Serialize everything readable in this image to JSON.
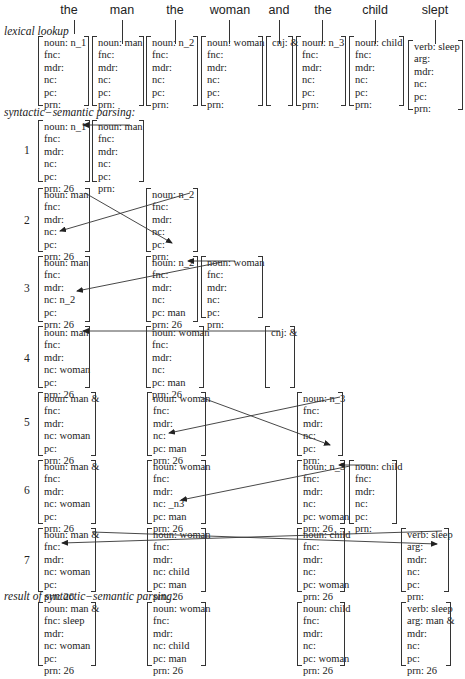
{
  "words": [
    "the",
    "man",
    "the",
    "woman",
    "and",
    "the",
    "child",
    "slept"
  ],
  "labels": {
    "lexical": "lexical lookup",
    "parsing": "syntactic−semantic parsing:",
    "result": "result of syntactic−semantic parsing:"
  },
  "lexical": [
    [
      "noun: n_1",
      "fnc:",
      "mdr:",
      "nc:",
      "pc:",
      "prn:"
    ],
    [
      "noun: man",
      "fnc:",
      "mdr:",
      "nc:",
      "pc:",
      "prn:"
    ],
    [
      "noun: n_2",
      "fnc:",
      "mdr:",
      "nc:",
      "pc:",
      "prn:"
    ],
    [
      "noun: woman",
      "fnc:",
      "mdr:",
      "nc:",
      "pc:",
      "prn:"
    ],
    [
      "cnj: &"
    ],
    [
      "noun: n_3",
      "fnc:",
      "mdr:",
      "nc:",
      "pc:",
      "prn:"
    ],
    [
      "noun: child",
      "fnc:",
      "mdr:",
      "nc:",
      "pc:",
      "prn:"
    ],
    [
      "verb: sleep",
      "arg:",
      "mdr:",
      "nc:",
      "pc:",
      "prn:"
    ]
  ],
  "steps": {
    "s1": {
      "num": "1",
      "a": [
        "noun: n_1",
        "fnc:",
        "mdr:",
        "nc:",
        "pc:",
        "prn: 26"
      ],
      "b": [
        "noun: man",
        "fnc:",
        "mdr:",
        "nc:",
        "pc:",
        "prn:"
      ]
    },
    "s2": {
      "num": "2",
      "a": [
        "noun: man",
        "fnc:",
        "mdr:",
        "nc:",
        "pc:",
        "prn: 26"
      ],
      "b": [
        "noun: n_2",
        "fnc:",
        "mdr:",
        "nc:",
        "pc:",
        "prn:"
      ]
    },
    "s3": {
      "num": "3",
      "a": [
        "noun: man",
        "fnc:",
        "mdr:",
        "nc: n_2",
        "pc:",
        "prn: 26"
      ],
      "b": [
        "noun: n_2",
        "fnc:",
        "mdr:",
        "nc:",
        "pc: man",
        "prn: 26"
      ],
      "c": [
        "noun: woman",
        "fnc:",
        "mdr:",
        "nc:",
        "pc:",
        "prn:"
      ]
    },
    "s4": {
      "num": "4",
      "a": [
        "noun: man",
        "fnc:",
        "mdr:",
        "nc: woman",
        "pc:",
        "prn: 26"
      ],
      "b": [
        "noun: woman",
        "fnc:",
        "mdr:",
        "nc:",
        "pc: man",
        "prn: 26"
      ],
      "c": [
        "cnj: &"
      ]
    },
    "s5": {
      "num": "5",
      "a": [
        "noun: man &",
        "fnc:",
        "mdr:",
        "nc: woman",
        "pc:",
        "prn: 26"
      ],
      "b": [
        "noun: woman",
        "fnc:",
        "mdr:",
        "nc:",
        "pc: man",
        "prn: 26"
      ],
      "c": [
        "noun: n_3",
        "fnc:",
        "mdr:",
        "nc:",
        "pc:",
        "prn:"
      ]
    },
    "s6": {
      "num": "6",
      "a": [
        "noun: man &",
        "fnc:",
        "mdr:",
        "nc: woman",
        "pc:",
        "prn: 26"
      ],
      "b": [
        "noun: woman",
        "fnc:",
        "mdr:",
        "nc: _n3",
        "pc: man",
        "prn: 26"
      ],
      "c": [
        "noun: n_3",
        "fnc:",
        "mdr:",
        "nc:",
        "pc: woman",
        "prn: 26"
      ],
      "d": [
        "noun: child",
        "fnc:",
        "mdr:",
        "nc:",
        "pc:",
        "prn:"
      ]
    },
    "s7": {
      "num": "7",
      "a": [
        "noun: man &",
        "fnc:",
        "mdr:",
        "nc: woman",
        "pc:",
        "prn: 26"
      ],
      "b": [
        "noun: woman",
        "fnc:",
        "mdr:",
        "nc: child",
        "pc: man",
        "prn: 26"
      ],
      "c": [
        "noun: child",
        "fnc:",
        "mdr:",
        "nc:",
        "pc: woman",
        "prn: 26"
      ],
      "d": [
        "verb: sleep",
        "arg:",
        "mdr:",
        "nc:",
        "pc:",
        "prn:"
      ]
    }
  },
  "result": [
    [
      "noun: man &",
      "fnc: sleep",
      "mdr:",
      "nc: woman",
      "pc:",
      "prn: 26"
    ],
    [
      "noun: woman",
      "fnc:",
      "mdr:",
      "nc: child",
      "pc: man",
      "prn: 26"
    ],
    [
      "noun: child",
      "fnc:",
      "mdr:",
      "nc:",
      "pc: woman",
      "prn: 26"
    ],
    [
      "verb: sleep",
      "arg: man &",
      "mdr:",
      "nc:",
      "pc:",
      "prn: 26"
    ]
  ]
}
